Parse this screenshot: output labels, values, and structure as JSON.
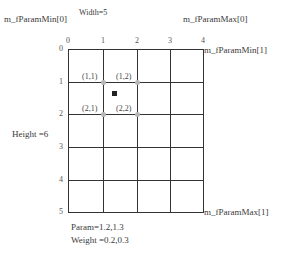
{
  "labels": {
    "param_min0": "m_fParamMin[0]",
    "width": "Width=5",
    "param_max0": "m_fParamMax[0]",
    "param_min1": "m_fParamMin[1]",
    "param_max1": "m_fParamMax[1]",
    "height": "Height =6",
    "param": "Param=1.2,1.3",
    "weight": "Weight =0.2,0.3"
  },
  "x_ticks": [
    "0",
    "1",
    "2",
    "3",
    "4"
  ],
  "y_ticks": [
    "0",
    "1",
    "2",
    "3",
    "4",
    "5"
  ],
  "points": [
    {
      "label": "(1,1)"
    },
    {
      "label": "(1,2)"
    },
    {
      "label": "(2,1)"
    },
    {
      "label": "(2,2)"
    }
  ],
  "colors": {
    "grid_line": "#333333",
    "point_dot": "#b5b5b5",
    "sample_square": "#222222"
  }
}
